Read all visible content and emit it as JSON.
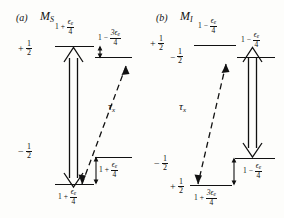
{
  "figure": {
    "panels": [
      {
        "tag": "(a)",
        "name_main": "M",
        "name_sub": "S",
        "tau_label_main": "τ",
        "tau_label_sub": "x",
        "levels": [
          {
            "quantum_lead": "+",
            "quantum_num": "1",
            "quantum_den": "2",
            "energy_pre": "1 +",
            "energy_num": "ϵ",
            "energy_num_sub": "e",
            "energy_den": "4",
            "position": "upper-left"
          },
          {
            "quantum_lead": "−",
            "quantum_num": "1",
            "quantum_den": "2",
            "energy_pre": "1 +",
            "energy_num": "ϵ",
            "energy_num_sub": "e",
            "energy_den": "4",
            "position": "lower-left"
          },
          {
            "energy_pre": "1 −",
            "energy_num": "3ϵ",
            "energy_num_sub": "e",
            "energy_den": "4",
            "position": "upper-right"
          },
          {
            "energy_pre": "1 +",
            "energy_num": "ϵ",
            "energy_num_sub": "e",
            "energy_den": "4",
            "position": "lower-right"
          }
        ]
      },
      {
        "tag": "(b)",
        "name_main": "M",
        "name_sub": "I",
        "tau_label_main": "τ",
        "tau_label_sub": "x",
        "levels": [
          {
            "quantum_lead": "+",
            "quantum_num": "1",
            "quantum_den": "2",
            "energy_pre": "1 −",
            "energy_num": "ϵ",
            "energy_num_sub": "e",
            "energy_den": "4",
            "position": "upper-left"
          },
          {
            "quantum_lead": "−",
            "quantum_num": "1",
            "quantum_den": "2",
            "position": "upper-left-second"
          },
          {
            "energy_pre": "1 −",
            "energy_num": "ϵ",
            "energy_num_sub": "e",
            "energy_den": "4",
            "position": "upper-right"
          },
          {
            "quantum_lead": "−",
            "quantum_num": "1",
            "quantum_den": "2",
            "position": "lower-left-first"
          },
          {
            "quantum_lead": "+",
            "quantum_num": "1",
            "quantum_den": "2",
            "energy_pre": "1 +",
            "energy_num": "3ϵ",
            "energy_num_sub": "e",
            "energy_den": "4",
            "position": "lower-left"
          },
          {
            "energy_pre": "1 −",
            "energy_num": "ϵ",
            "energy_num_sub": "e",
            "energy_den": "4",
            "position": "lower-right"
          }
        ]
      }
    ],
    "colors": {
      "ink": "#111111",
      "background": "#fdfdfb"
    }
  }
}
